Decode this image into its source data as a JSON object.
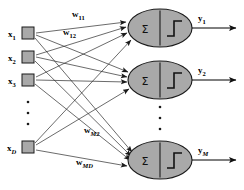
{
  "diagram": {
    "type": "single-layer-perceptron-network",
    "canvas": {
      "width": 244,
      "height": 190,
      "background": "#ffffff"
    },
    "colors": {
      "node_fill": "#a9a9a9",
      "node_stroke": "#1a1a1a",
      "connection": "#2b2b2b",
      "text": "#000000"
    },
    "inputs": [
      {
        "id": "x1",
        "base": "x",
        "sub": "1",
        "sub_italic": false,
        "cx": 28,
        "cy": 33
      },
      {
        "id": "x2",
        "base": "x",
        "sub": "2",
        "sub_italic": false,
        "cx": 28,
        "cy": 57
      },
      {
        "id": "x3",
        "base": "x",
        "sub": "3",
        "sub_italic": false,
        "cx": 28,
        "cy": 80
      },
      {
        "id": "xD",
        "base": "x",
        "sub": "D",
        "sub_italic": true,
        "cx": 28,
        "cy": 147
      }
    ],
    "input_ellipsis": {
      "dots": 3,
      "x": 28,
      "y_start": 102,
      "y_step": 11
    },
    "neurons": [
      {
        "id": "n1",
        "cx": 160,
        "cy": 28,
        "rx": 32,
        "ry": 19,
        "sum_symbol": "Σ",
        "activation": "step"
      },
      {
        "id": "n2",
        "cx": 160,
        "cy": 80,
        "rx": 32,
        "ry": 19,
        "sum_symbol": "Σ",
        "activation": "step"
      },
      {
        "id": "n3",
        "cx": 160,
        "cy": 160,
        "rx": 32,
        "ry": 19,
        "sum_symbol": "Σ",
        "activation": "step"
      }
    ],
    "neuron_ellipsis": {
      "dots": 3,
      "x": 160,
      "y_start": 107,
      "y_step": 11
    },
    "outputs": [
      {
        "id": "y1",
        "base": "y",
        "sub": "1",
        "sub_italic": false,
        "label_x": 200,
        "label_y": 18,
        "line_y": 28,
        "x_start": 192,
        "x_end": 238
      },
      {
        "id": "y2",
        "base": "y",
        "sub": "2",
        "sub_italic": false,
        "label_x": 200,
        "label_y": 70,
        "line_y": 80,
        "x_start": 192,
        "x_end": 238
      },
      {
        "id": "yM",
        "base": "y",
        "sub": "M",
        "sub_italic": true,
        "label_x": 200,
        "label_y": 150,
        "line_y": 160,
        "x_start": 192,
        "x_end": 238
      }
    ],
    "weight_labels": [
      {
        "id": "w11",
        "base": "w",
        "sub": "11",
        "sub_italic": false,
        "x": 75,
        "y": 17
      },
      {
        "id": "w12",
        "base": "w",
        "sub": "12",
        "sub_italic": false,
        "x": 66,
        "y": 35
      },
      {
        "id": "wM2",
        "base": "w",
        "sub": "M2",
        "sub_italic": true,
        "x": 86,
        "y": 133
      },
      {
        "id": "wMD",
        "base": "w",
        "sub": "MD",
        "sub_italic": true,
        "x": 78,
        "y": 165
      }
    ],
    "connections": [
      {
        "from": "x1",
        "to": "n1"
      },
      {
        "from": "x1",
        "to": "n2"
      },
      {
        "from": "x1",
        "to": "n3"
      },
      {
        "from": "x2",
        "to": "n1"
      },
      {
        "from": "x2",
        "to": "n2"
      },
      {
        "from": "x2",
        "to": "n3"
      },
      {
        "from": "x3",
        "to": "n1"
      },
      {
        "from": "x3",
        "to": "n2"
      },
      {
        "from": "x3",
        "to": "n3"
      },
      {
        "from": "xD",
        "to": "n1"
      },
      {
        "from": "xD",
        "to": "n2"
      },
      {
        "from": "xD",
        "to": "n3"
      }
    ]
  }
}
